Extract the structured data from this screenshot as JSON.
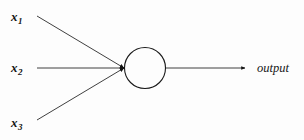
{
  "diagram": {
    "background_color": "#fdfdfd",
    "stroke_color": "#1a1a1a",
    "node": {
      "name": "neuron-body",
      "shape": "circle",
      "cx": 145,
      "cy": 68,
      "r": 20.5,
      "fill": "none",
      "stroke": "#1a1a1a"
    },
    "inputs": [
      {
        "id": "x1",
        "label": "x",
        "subscript": "1",
        "start_x": 37,
        "start_y": 16,
        "end_x": 124,
        "end_y": 68
      },
      {
        "id": "x2",
        "label": "x",
        "subscript": "2",
        "start_x": 37,
        "start_y": 68,
        "end_x": 124,
        "end_y": 68
      },
      {
        "id": "x3",
        "label": "x",
        "subscript": "3",
        "start_x": 37,
        "start_y": 120,
        "end_x": 124,
        "end_y": 68
      }
    ],
    "output": {
      "id": "output",
      "label": "output",
      "start_x": 166,
      "start_y": 68,
      "end_x": 245,
      "end_y": 68
    }
  }
}
